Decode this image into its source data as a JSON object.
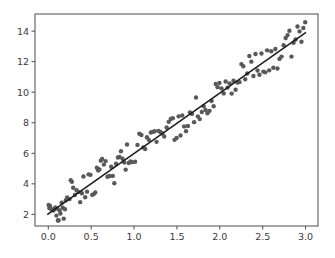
{
  "chart_data": {
    "type": "scatter",
    "title": "",
    "xlabel": "",
    "ylabel": "",
    "xlim": [
      -0.155,
      3.145
    ],
    "ylim": [
      1.24,
      15.12
    ],
    "grid": false,
    "legend": null,
    "xticks": [
      0.0,
      0.5,
      1.0,
      1.5,
      2.0,
      2.5,
      3.0
    ],
    "xtick_labels": [
      "0.0",
      "0.5",
      "1.0",
      "1.5",
      "2.0",
      "2.5",
      "3.0"
    ],
    "yticks": [
      2,
      4,
      6,
      8,
      10,
      12,
      14
    ],
    "ytick_labels": [
      "2",
      "4",
      "6",
      "8",
      "10",
      "12",
      "14"
    ],
    "marker_color": "#595959",
    "marker_size": 4.4,
    "line_color": "#1a1a1a",
    "line_width": 1.5,
    "axes_color": "#4d4d4d",
    "background_color": "#ffffff",
    "series": [
      {
        "name": "observations",
        "type": "scatter",
        "points": [
          [
            0.004,
            2.61
          ],
          [
            0.012,
            2.42
          ],
          [
            0.02,
            2.56
          ],
          [
            0.031,
            2.36
          ],
          [
            0.046,
            2.3
          ],
          [
            0.058,
            2.25
          ],
          [
            0.07,
            2.33
          ],
          [
            0.082,
            2.45
          ],
          [
            0.095,
            1.92
          ],
          [
            0.104,
            2.38
          ],
          [
            0.112,
            1.6
          ],
          [
            0.12,
            1.62
          ],
          [
            0.131,
            2.25
          ],
          [
            0.142,
            2.06
          ],
          [
            0.156,
            2.77
          ],
          [
            0.168,
            2.43
          ],
          [
            0.18,
            1.72
          ],
          [
            0.194,
            2.34
          ],
          [
            0.205,
            2.93
          ],
          [
            0.22,
            3.11
          ],
          [
            0.248,
            3.0
          ],
          [
            0.262,
            4.24
          ],
          [
            0.276,
            4.13
          ],
          [
            0.29,
            3.74
          ],
          [
            0.31,
            3.27
          ],
          [
            0.33,
            3.58
          ],
          [
            0.352,
            3.47
          ],
          [
            0.372,
            2.8
          ],
          [
            0.392,
            3.38
          ],
          [
            0.41,
            4.48
          ],
          [
            0.43,
            3.12
          ],
          [
            0.452,
            3.49
          ],
          [
            0.47,
            4.62
          ],
          [
            0.492,
            4.59
          ],
          [
            0.512,
            3.28
          ],
          [
            0.53,
            3.33
          ],
          [
            0.548,
            3.44
          ],
          [
            0.566,
            5.05
          ],
          [
            0.582,
            4.88
          ],
          [
            0.596,
            4.95
          ],
          [
            0.612,
            5.52
          ],
          [
            0.628,
            5.63
          ],
          [
            0.648,
            5.26
          ],
          [
            0.668,
            5.49
          ],
          [
            0.69,
            4.46
          ],
          [
            0.712,
            4.51
          ],
          [
            0.734,
            5.12
          ],
          [
            0.752,
            4.52
          ],
          [
            0.77,
            4.04
          ],
          [
            0.79,
            5.32
          ],
          [
            0.812,
            5.72
          ],
          [
            0.83,
            5.76
          ],
          [
            0.848,
            6.13
          ],
          [
            0.866,
            5.64
          ],
          [
            0.886,
            5.4
          ],
          [
            0.902,
            4.93
          ],
          [
            0.918,
            6.58
          ],
          [
            0.938,
            5.36
          ],
          [
            0.958,
            5.47
          ],
          [
            0.976,
            5.42
          ],
          [
            1.012,
            5.45
          ],
          [
            1.04,
            6.55
          ],
          [
            1.062,
            7.28
          ],
          [
            1.086,
            7.2
          ],
          [
            1.108,
            6.38
          ],
          [
            1.13,
            6.28
          ],
          [
            1.15,
            7.05
          ],
          [
            1.172,
            6.88
          ],
          [
            1.196,
            7.36
          ],
          [
            1.218,
            7.4
          ],
          [
            1.24,
            7.44
          ],
          [
            1.262,
            6.75
          ],
          [
            1.284,
            7.47
          ],
          [
            1.306,
            7.39
          ],
          [
            1.33,
            7.3
          ],
          [
            1.352,
            7.1
          ],
          [
            1.38,
            7.69
          ],
          [
            1.404,
            8.06
          ],
          [
            1.428,
            8.25
          ],
          [
            1.452,
            8.3
          ],
          [
            1.472,
            6.88
          ],
          [
            1.496,
            7.0
          ],
          [
            1.52,
            8.42
          ],
          [
            1.542,
            7.17
          ],
          [
            1.562,
            8.47
          ],
          [
            1.584,
            7.76
          ],
          [
            1.606,
            7.45
          ],
          [
            1.628,
            7.79
          ],
          [
            1.652,
            8.68
          ],
          [
            1.676,
            8.58
          ],
          [
            1.7,
            8.04
          ],
          [
            1.722,
            9.65
          ],
          [
            1.744,
            8.42
          ],
          [
            1.766,
            8.24
          ],
          [
            1.79,
            8.7
          ],
          [
            1.812,
            9.08
          ],
          [
            1.834,
            8.84
          ],
          [
            1.856,
            8.62
          ],
          [
            1.88,
            8.78
          ],
          [
            1.904,
            9.42
          ],
          [
            1.928,
            9.08
          ],
          [
            1.952,
            10.54
          ],
          [
            1.974,
            10.33
          ],
          [
            1.996,
            10.6
          ],
          [
            2.02,
            10.25
          ],
          [
            2.046,
            9.92
          ],
          [
            2.068,
            10.7
          ],
          [
            2.09,
            10.3
          ],
          [
            2.114,
            10.58
          ],
          [
            2.138,
            9.91
          ],
          [
            2.16,
            10.75
          ],
          [
            2.184,
            10.16
          ],
          [
            2.206,
            10.64
          ],
          [
            2.23,
            10.66
          ],
          [
            2.252,
            11.84
          ],
          [
            2.274,
            11.7
          ],
          [
            2.296,
            10.85
          ],
          [
            2.32,
            11.22
          ],
          [
            2.344,
            12.37
          ],
          [
            2.368,
            12.0
          ],
          [
            2.392,
            11.06
          ],
          [
            2.416,
            12.5
          ],
          [
            2.44,
            11.42
          ],
          [
            2.462,
            11.14
          ],
          [
            2.486,
            12.53
          ],
          [
            2.508,
            11.35
          ],
          [
            2.53,
            11.3
          ],
          [
            2.552,
            12.74
          ],
          [
            2.576,
            11.43
          ],
          [
            2.6,
            12.68
          ],
          [
            2.624,
            11.6
          ],
          [
            2.648,
            12.83
          ],
          [
            2.672,
            11.55
          ],
          [
            2.696,
            12.18
          ],
          [
            2.72,
            12.33
          ],
          [
            2.744,
            13.08
          ],
          [
            2.768,
            13.55
          ],
          [
            2.79,
            13.74
          ],
          [
            2.812,
            14.02
          ],
          [
            2.836,
            12.33
          ],
          [
            2.86,
            13.24
          ],
          [
            2.884,
            13.45
          ],
          [
            2.906,
            14.3
          ],
          [
            2.93,
            13.98
          ],
          [
            2.952,
            13.3
          ],
          [
            2.974,
            14.2
          ],
          [
            2.996,
            14.58
          ]
        ]
      },
      {
        "name": "fit-line",
        "type": "line",
        "x": [
          -0.012,
          3.005
        ],
        "y": [
          1.98,
          13.92
        ]
      }
    ]
  }
}
